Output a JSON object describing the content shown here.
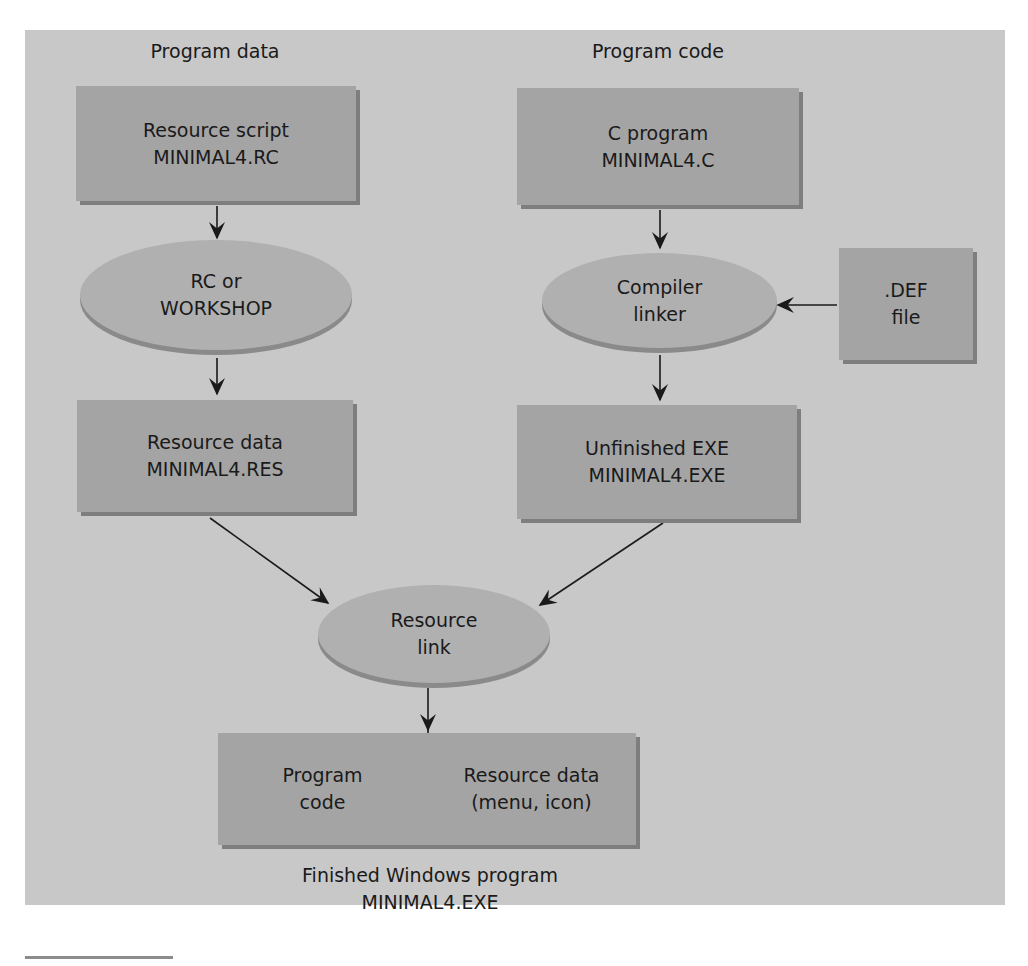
{
  "headings": {
    "program_data": "Program data",
    "program_code": "Program code"
  },
  "nodes": {
    "resource_script": {
      "line1": "Resource script",
      "line2": "MINIMAL4.RC"
    },
    "c_program": {
      "line1": "C program",
      "line2": "MINIMAL4.C"
    },
    "rc_workshop": {
      "line1": "RC or",
      "line2": "WORKSHOP"
    },
    "compiler_linker": {
      "line1": "Compiler",
      "line2": "linker"
    },
    "def_file": {
      "line1": ".DEF",
      "line2": "file"
    },
    "resource_data": {
      "line1": "Resource data",
      "line2": "MINIMAL4.RES"
    },
    "unfinished_exe": {
      "line1": "Unfinished EXE",
      "line2": "MINIMAL4.EXE"
    },
    "resource_link": {
      "line1": "Resource",
      "line2": "link"
    },
    "finished": {
      "left": {
        "line1": "Program",
        "line2": "code"
      },
      "right": {
        "line1": "Resource data",
        "line2": "(menu, icon)"
      }
    }
  },
  "caption": {
    "line1": "Finished Windows program",
    "line2": "MINIMAL4.EXE"
  },
  "colors": {
    "panel": "#c8c8c8",
    "box": "#a4a4a4",
    "ellipse": "#b0b0b0",
    "shadow": "#7e7e7e"
  }
}
